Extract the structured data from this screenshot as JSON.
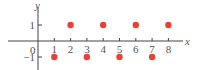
{
  "chart_data": {
    "type": "scatter",
    "title": "",
    "xlabel": "x",
    "ylabel": "y",
    "x_ticks": [
      "1",
      "2",
      "3",
      "4",
      "5",
      "6",
      "7",
      "8"
    ],
    "y_ticks": [
      "1",
      "-1"
    ],
    "origin_label": "0",
    "xlim": [
      0,
      8.5
    ],
    "ylim": [
      -1.4,
      1.9
    ],
    "grid": false,
    "legend": null,
    "point_color": "#e8403a",
    "series": [
      {
        "name": "points",
        "x": [
          1,
          2,
          3,
          4,
          5,
          6,
          7,
          8
        ],
        "y": [
          -1,
          1,
          -1,
          1,
          -1,
          1,
          -1,
          1
        ]
      }
    ]
  }
}
